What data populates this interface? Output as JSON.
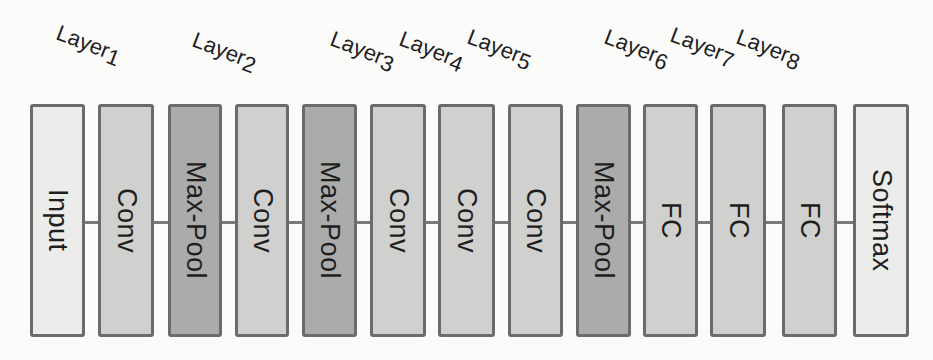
{
  "diagram": {
    "type": "cnn-architecture",
    "colors": {
      "background": "#fbfbfa",
      "border": "#6b6b6b",
      "connector": "#7a7a7a",
      "input_softmax_fill": "#ececeb",
      "conv_fc_fill": "#d0d0cf",
      "maxpool_fill": "#ababab",
      "text": "#1e1e1e"
    },
    "blocks": [
      {
        "label": "Input",
        "kind": "light"
      },
      {
        "label": "Conv",
        "kind": "mid"
      },
      {
        "label": "Max-Pool",
        "kind": "dark"
      },
      {
        "label": "Conv",
        "kind": "mid"
      },
      {
        "label": "Max-Pool",
        "kind": "dark"
      },
      {
        "label": "Conv",
        "kind": "mid"
      },
      {
        "label": "Conv",
        "kind": "mid"
      },
      {
        "label": "Conv",
        "kind": "mid"
      },
      {
        "label": "Max-Pool",
        "kind": "dark"
      },
      {
        "label": "FC",
        "kind": "mid"
      },
      {
        "label": "FC",
        "kind": "mid"
      },
      {
        "label": "FC",
        "kind": "mid"
      },
      {
        "label": "Softmax",
        "kind": "light"
      }
    ],
    "layer_tags": [
      {
        "prefix": "Layer",
        "num": "1"
      },
      {
        "prefix": "Layer",
        "num": "2"
      },
      {
        "prefix": "Layer",
        "num": "3"
      },
      {
        "prefix": "Layer",
        "num": "4"
      },
      {
        "prefix": "Layer",
        "num": "5"
      },
      {
        "prefix": "Layer",
        "num": "6"
      },
      {
        "prefix": "Layer",
        "num": "7"
      },
      {
        "prefix": "Layer",
        "num": "8"
      }
    ]
  }
}
